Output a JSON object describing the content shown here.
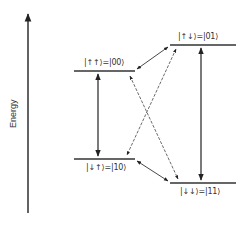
{
  "axis": {
    "label": "Energy"
  },
  "levels": [
    {
      "id": "00",
      "label": "|↑↑⟩=|00⟩"
    },
    {
      "id": "01",
      "label": "|↑↓⟩=|01⟩"
    },
    {
      "id": "10",
      "label": "|↓↑⟩=|10⟩"
    },
    {
      "id": "11",
      "label": "|↓↓⟩=|11⟩"
    }
  ],
  "transitions": [
    {
      "from": "00",
      "to": "10",
      "style": "solid",
      "arrows": "both"
    },
    {
      "from": "01",
      "to": "11",
      "style": "solid",
      "arrows": "both"
    },
    {
      "from": "00",
      "to": "01",
      "style": "solid",
      "arrows": "both"
    },
    {
      "from": "10",
      "to": "11",
      "style": "solid",
      "arrows": "both"
    },
    {
      "from": "00",
      "to": "11",
      "style": "dashed",
      "arrows": "both"
    },
    {
      "from": "01",
      "to": "10",
      "style": "dashed",
      "arrows": "both"
    }
  ],
  "colors": {
    "line": "#222222",
    "background": "#ffffff"
  }
}
